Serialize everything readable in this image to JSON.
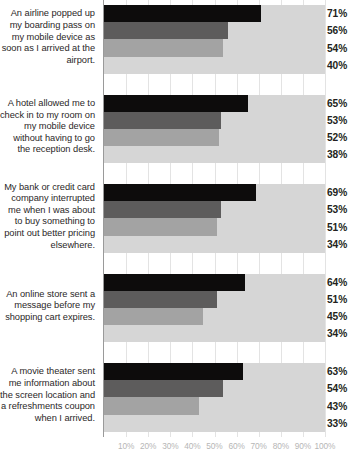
{
  "chart_data": {
    "type": "bar",
    "orientation": "horizontal",
    "title": "",
    "xlabel": "",
    "ylabel": "",
    "xlim": [
      0,
      100
    ],
    "grid": true,
    "legend": "none",
    "xtick_labels": [
      "10%",
      "20%",
      "30%",
      "40%",
      "50%",
      "60%",
      "70%",
      "80%",
      "90%",
      "100%"
    ],
    "xtick_values": [
      10,
      20,
      30,
      40,
      50,
      60,
      70,
      80,
      90,
      100
    ],
    "categories": [
      "An airline popped up my boarding pass on my mobile device as soon as I arrived at the airport.",
      "A hotel allowed me to check in to my room on my mobile device without having to go the reception desk.",
      "My bank or credit card company interrupted me when I was about to buy something to point out better pricing elsewhere.",
      "An online store sent a message before my shopping cart expires.",
      "A movie theater sent me information about the screen location and a refreshments coupon when I arrived."
    ],
    "series": [
      {
        "name": "series-1",
        "color": "#0d0c0c",
        "values": [
          71,
          65,
          69,
          64,
          63
        ]
      },
      {
        "name": "series-2",
        "color": "#5d5c5c",
        "values": [
          56,
          53,
          53,
          51,
          54
        ]
      },
      {
        "name": "series-3",
        "color": "#a3a3a3",
        "values": [
          54,
          52,
          51,
          45,
          43
        ]
      },
      {
        "name": "series-4",
        "color": "#d6d6d6",
        "values": [
          40,
          38,
          34,
          34,
          33
        ]
      }
    ],
    "value_labels": [
      [
        "71%",
        "56%",
        "54%",
        "40%"
      ],
      [
        "65%",
        "53%",
        "52%",
        "38%"
      ],
      [
        "69%",
        "53%",
        "51%",
        "34%"
      ],
      [
        "64%",
        "51%",
        "45%",
        "34%"
      ],
      [
        "63%",
        "54%",
        "43%",
        "33%"
      ]
    ]
  },
  "groups": [
    {
      "label": "An airline popped up my boarding pass on my mobile device as soon as I arrived at the airport.",
      "values": [
        71,
        56,
        54,
        40
      ],
      "value_labels": [
        "71%",
        "56%",
        "54%",
        "40%"
      ]
    },
    {
      "label": "A hotel allowed me to check in to my room on my mobile device without having to go the reception desk.",
      "values": [
        65,
        53,
        52,
        38
      ],
      "value_labels": [
        "65%",
        "53%",
        "52%",
        "38%"
      ]
    },
    {
      "label": "My bank or credit card company interrupted me when I was about to buy something to point out better pricing elsewhere.",
      "values": [
        69,
        53,
        51,
        34
      ],
      "value_labels": [
        "69%",
        "53%",
        "51%",
        "34%"
      ]
    },
    {
      "label": "An online store sent a message before my shopping cart expires.",
      "values": [
        64,
        51,
        45,
        34
      ],
      "value_labels": [
        "64%",
        "51%",
        "45%",
        "34%"
      ]
    },
    {
      "label": "A movie theater sent me information about the screen location and a refreshments coupon when I arrived.",
      "values": [
        63,
        54,
        43,
        33
      ],
      "value_labels": [
        "63%",
        "54%",
        "43%",
        "33%"
      ]
    }
  ]
}
